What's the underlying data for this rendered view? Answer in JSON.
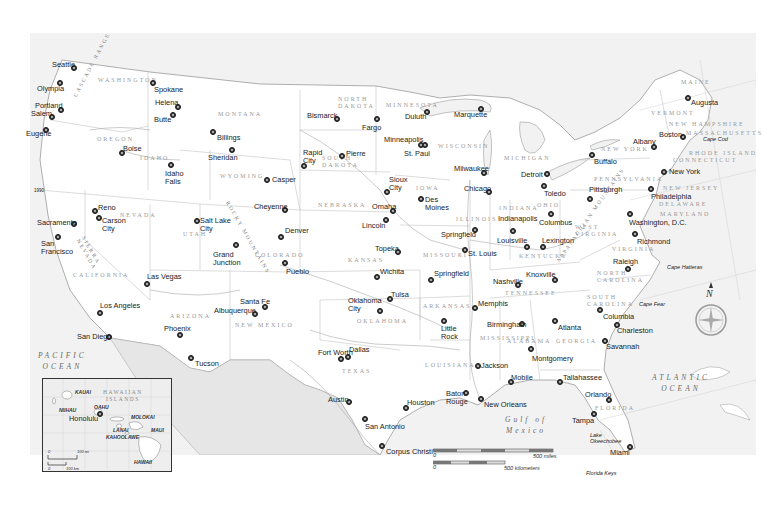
{
  "map": {
    "title": "United States reference map",
    "oceans": [
      {
        "id": "pacific",
        "label": "PACIFIC\nOCEAN"
      },
      {
        "id": "atlantic",
        "label": "ATLANTIC\nOCEAN"
      },
      {
        "id": "gulf",
        "label": "Gulf of\nMexico"
      }
    ],
    "states": [
      "WASHINGTON",
      "OREGON",
      "CALIFORNIA",
      "NEVADA",
      "IDAHO",
      "MONTANA",
      "WYOMING",
      "UTAH",
      "COLORADO",
      "ARIZONA",
      "NEW MEXICO",
      "NORTH DAKOTA",
      "SOUTH DAKOTA",
      "NEBRASKA",
      "KANSAS",
      "OKLAHOMA",
      "TEXAS",
      "MINNESOTA",
      "IOWA",
      "MISSOURI",
      "ARKANSAS",
      "LOUISIANA",
      "WISCONSIN",
      "ILLINOIS",
      "MICHIGAN",
      "INDIANA",
      "OHIO",
      "KENTUCKY",
      "TENNESSEE",
      "MISSISSIPPI",
      "ALABAMA",
      "GEORGIA",
      "FLORIDA",
      "SOUTH CAROLINA",
      "NORTH CAROLINA",
      "VIRGINIA",
      "WEST VIRGINIA",
      "PENNSYLVANIA",
      "NEW YORK",
      "VERMONT",
      "NEW HAMPSHIRE",
      "MAINE",
      "MASSACHUSETTS",
      "RHODE ISLAND",
      "CONNECTICUT",
      "NEW JERSEY",
      "DELAWARE",
      "MARYLAND"
    ],
    "mountains": [
      "CASCADE RANGE",
      "SIERRA NEVADA",
      "ROCKY MOUNTAINS",
      "APPALACHIAN MOUNTAINS"
    ],
    "features": [
      "Cape Cod",
      "Cape Hatteras",
      "Cape Fear",
      "Florida Keys",
      "Lake Okeechobee",
      "Great Salt Lake",
      "Lake Superior",
      "Lake Michigan",
      "Lake Huron",
      "Lake Erie",
      "Lake Ontario"
    ],
    "rivers": [
      "Columbia",
      "Snake",
      "Missouri",
      "Mississippi",
      "Arkansas",
      "Red",
      "Rio Grande",
      "Colorado",
      "Ohio",
      "Tennessee"
    ],
    "cities": [
      {
        "name": "Seattle",
        "x": 74,
        "y": 68,
        "lx": 52,
        "ly": 61
      },
      {
        "name": "Olympia",
        "x": 60,
        "y": 83,
        "lx": 37,
        "ly": 85
      },
      {
        "name": "Spokane",
        "x": 153,
        "y": 83,
        "lx": 154,
        "ly": 86
      },
      {
        "name": "Portland",
        "x": 61,
        "y": 110,
        "lx": 35,
        "ly": 102
      },
      {
        "name": "Salem",
        "x": 52,
        "y": 117,
        "lx": 31,
        "ly": 110
      },
      {
        "name": "Eugene",
        "x": 46,
        "y": 130,
        "lx": 26,
        "ly": 130
      },
      {
        "name": "Helena",
        "x": 178,
        "y": 107,
        "lx": 155,
        "ly": 99
      },
      {
        "name": "Butte",
        "x": 173,
        "y": 115,
        "lx": 154,
        "ly": 116
      },
      {
        "name": "Billings",
        "x": 213,
        "y": 132,
        "lx": 217,
        "ly": 134
      },
      {
        "name": "Boise",
        "x": 122,
        "y": 153,
        "lx": 123,
        "ly": 145
      },
      {
        "name": "Sheridan",
        "x": 232,
        "y": 150,
        "lx": 208,
        "ly": 154
      },
      {
        "name": "Idaho\nFalls",
        "x": 171,
        "y": 165,
        "lx": 165,
        "ly": 170
      },
      {
        "name": "Casper",
        "x": 267,
        "y": 180,
        "lx": 272,
        "ly": 176
      },
      {
        "name": "Cheyenne",
        "x": 285,
        "y": 210,
        "lx": 254,
        "ly": 203
      },
      {
        "name": "Salt Lake\nCity",
        "x": 197,
        "y": 221,
        "lx": 200,
        "ly": 217
      },
      {
        "name": "Reno",
        "x": 95,
        "y": 211,
        "lx": 98,
        "ly": 204
      },
      {
        "name": "Carson\nCity",
        "x": 99,
        "y": 218,
        "lx": 102,
        "ly": 217
      },
      {
        "name": "Sacramento",
        "x": 74,
        "y": 224,
        "lx": 37,
        "ly": 219
      },
      {
        "name": "San\nFrancisco",
        "x": 58,
        "y": 237,
        "lx": 41,
        "ly": 240
      },
      {
        "name": "Denver",
        "x": 281,
        "y": 237,
        "lx": 285,
        "ly": 227
      },
      {
        "name": "Grand\nJunction",
        "x": 236,
        "y": 245,
        "lx": 213,
        "ly": 251
      },
      {
        "name": "Pueblo",
        "x": 285,
        "y": 263,
        "lx": 286,
        "ly": 268
      },
      {
        "name": "Las Vegas",
        "x": 147,
        "y": 284,
        "lx": 147,
        "ly": 273
      },
      {
        "name": "Santa Fe",
        "x": 265,
        "y": 307,
        "lx": 240,
        "ly": 298
      },
      {
        "name": "Albuquerque",
        "x": 255,
        "y": 314,
        "lx": 214,
        "ly": 307
      },
      {
        "name": "Los Angeles",
        "x": 100,
        "y": 313,
        "lx": 100,
        "ly": 302
      },
      {
        "name": "Phoenix",
        "x": 180,
        "y": 335,
        "lx": 164,
        "ly": 325
      },
      {
        "name": "San Diego",
        "x": 109,
        "y": 337,
        "lx": 77,
        "ly": 333
      },
      {
        "name": "Tucson",
        "x": 191,
        "y": 358,
        "lx": 195,
        "ly": 360
      },
      {
        "name": "Bismarck",
        "x": 337,
        "y": 119,
        "lx": 307,
        "ly": 112
      },
      {
        "name": "Fargo",
        "x": 377,
        "y": 119,
        "lx": 362,
        "ly": 124
      },
      {
        "name": "Rapid\nCity",
        "x": 304,
        "y": 166,
        "lx": 303,
        "ly": 149
      },
      {
        "name": "Pierre",
        "x": 342,
        "y": 156,
        "lx": 346,
        "ly": 150
      },
      {
        "name": "Duluth",
        "x": 427,
        "y": 112,
        "lx": 405,
        "ly": 113
      },
      {
        "name": "Marquette",
        "x": 481,
        "y": 109,
        "lx": 454,
        "ly": 111
      },
      {
        "name": "Minneapolis",
        "x": 421,
        "y": 145,
        "lx": 384,
        "ly": 136
      },
      {
        "name": "St. Paul",
        "x": 425,
        "y": 145,
        "lx": 404,
        "ly": 150
      },
      {
        "name": "Milwaukee",
        "x": 484,
        "y": 173,
        "lx": 454,
        "ly": 165
      },
      {
        "name": "Chicago",
        "x": 489,
        "y": 192,
        "lx": 464,
        "ly": 185
      },
      {
        "name": "Sioux\nCity",
        "x": 387,
        "y": 192,
        "lx": 389,
        "ly": 176
      },
      {
        "name": "Omaha",
        "x": 393,
        "y": 211,
        "lx": 372,
        "ly": 203
      },
      {
        "name": "Des\nMoines",
        "x": 421,
        "y": 199,
        "lx": 425,
        "ly": 196
      },
      {
        "name": "Lincoln",
        "x": 386,
        "y": 220,
        "lx": 362,
        "ly": 222
      },
      {
        "name": "Topeka",
        "x": 398,
        "y": 252,
        "lx": 375,
        "ly": 245
      },
      {
        "name": "Springfield",
        "x": 475,
        "y": 230,
        "lx": 441,
        "ly": 231
      },
      {
        "name": "Indianapolis",
        "x": 513,
        "y": 231,
        "lx": 498,
        "ly": 215
      },
      {
        "name": "St. Louis",
        "x": 465,
        "y": 250,
        "lx": 468,
        "ly": 250
      },
      {
        "name": "Louisville",
        "x": 527,
        "y": 247,
        "lx": 497,
        "ly": 237
      },
      {
        "name": "Wichita",
        "x": 377,
        "y": 277,
        "lx": 380,
        "ly": 268
      },
      {
        "name": "Springfield",
        "x": 431,
        "y": 280,
        "lx": 434,
        "ly": 270
      },
      {
        "name": "Tulsa",
        "x": 390,
        "y": 299,
        "lx": 391,
        "ly": 291
      },
      {
        "name": "Oklahoma\nCity",
        "x": 380,
        "y": 311,
        "lx": 348,
        "ly": 297
      },
      {
        "name": "Nashville",
        "x": 518,
        "y": 285,
        "lx": 493,
        "ly": 278
      },
      {
        "name": "Memphis",
        "x": 475,
        "y": 308,
        "lx": 478,
        "ly": 300
      },
      {
        "name": "Little\nRock",
        "x": 444,
        "y": 321,
        "lx": 441,
        "ly": 325
      },
      {
        "name": "Fort Worth",
        "x": 341,
        "y": 359,
        "lx": 318,
        "ly": 349
      },
      {
        "name": "Dallas",
        "x": 348,
        "y": 357,
        "lx": 349,
        "ly": 346
      },
      {
        "name": "Jackson",
        "x": 478,
        "y": 366,
        "lx": 481,
        "ly": 362
      },
      {
        "name": "Birmingham",
        "x": 522,
        "y": 324,
        "lx": 487,
        "ly": 321
      },
      {
        "name": "Atlanta",
        "x": 555,
        "y": 321,
        "lx": 558,
        "ly": 324
      },
      {
        "name": "Montgomery",
        "x": 531,
        "y": 349,
        "lx": 532,
        "ly": 355
      },
      {
        "name": "Austin",
        "x": 349,
        "y": 402,
        "lx": 328,
        "ly": 396
      },
      {
        "name": "Houston",
        "x": 406,
        "y": 408,
        "lx": 407,
        "ly": 399
      },
      {
        "name": "San Antonio",
        "x": 365,
        "y": 419,
        "lx": 365,
        "ly": 423
      },
      {
        "name": "Baton\nRouge",
        "x": 466,
        "y": 393,
        "lx": 446,
        "ly": 390
      },
      {
        "name": "New Orleans",
        "x": 481,
        "y": 399,
        "lx": 484,
        "ly": 401
      },
      {
        "name": "Mobile",
        "x": 511,
        "y": 382,
        "lx": 511,
        "ly": 374
      },
      {
        "name": "Tallahassee",
        "x": 560,
        "y": 382,
        "lx": 563,
        "ly": 374
      },
      {
        "name": "Corpus Christi",
        "x": 382,
        "y": 446,
        "lx": 386,
        "ly": 448
      },
      {
        "name": "Orlando",
        "x": 609,
        "y": 400,
        "lx": 585,
        "ly": 391
      },
      {
        "name": "Tampa",
        "x": 594,
        "y": 414,
        "lx": 572,
        "ly": 417
      },
      {
        "name": "Miami",
        "x": 630,
        "y": 447,
        "lx": 610,
        "ly": 449
      },
      {
        "name": "Detroit",
        "x": 547,
        "y": 174,
        "lx": 521,
        "ly": 171
      },
      {
        "name": "Toledo",
        "x": 544,
        "y": 186,
        "lx": 544,
        "ly": 190
      },
      {
        "name": "Columbus",
        "x": 551,
        "y": 214,
        "lx": 539,
        "ly": 219
      },
      {
        "name": "Lexington",
        "x": 543,
        "y": 247,
        "lx": 542,
        "ly": 237
      },
      {
        "name": "Knoxville",
        "x": 555,
        "y": 280,
        "lx": 526,
        "ly": 271
      },
      {
        "name": "Pittsburgh",
        "x": 590,
        "y": 199,
        "lx": 589,
        "ly": 186
      },
      {
        "name": "Buffalo",
        "x": 592,
        "y": 155,
        "lx": 594,
        "ly": 158
      },
      {
        "name": "Albany",
        "x": 654,
        "y": 147,
        "lx": 633,
        "ly": 138
      },
      {
        "name": "Boston",
        "x": 683,
        "y": 137,
        "lx": 659,
        "ly": 131
      },
      {
        "name": "Augusta",
        "x": 688,
        "y": 98,
        "lx": 691,
        "ly": 99
      },
      {
        "name": "New York",
        "x": 664,
        "y": 172,
        "lx": 669,
        "ly": 168
      },
      {
        "name": "Philadelphia",
        "x": 651,
        "y": 189,
        "lx": 651,
        "ly": 193
      },
      {
        "name": "Washington, D.C.",
        "x": 630,
        "y": 214,
        "lx": 629,
        "ly": 219
      },
      {
        "name": "Richmond",
        "x": 635,
        "y": 234,
        "lx": 637,
        "ly": 238
      },
      {
        "name": "Raleigh",
        "x": 628,
        "y": 269,
        "lx": 613,
        "ly": 258
      },
      {
        "name": "Columbia",
        "x": 600,
        "y": 310,
        "lx": 603,
        "ly": 313
      },
      {
        "name": "Charleston",
        "x": 617,
        "y": 325,
        "lx": 617,
        "ly": 327
      },
      {
        "name": "Savannah",
        "x": 605,
        "y": 341,
        "lx": 606,
        "ly": 343
      }
    ],
    "capes": [
      {
        "name": "Cape Cod",
        "x": 703,
        "y": 136
      },
      {
        "name": "Cape Hatteras",
        "x": 667,
        "y": 264
      },
      {
        "name": "Cape Fear",
        "x": 639,
        "y": 301
      },
      {
        "name": "Florida Keys",
        "x": 586,
        "y": 470
      },
      {
        "name": "Lake\nOkeechobee",
        "x": 590,
        "y": 432
      }
    ],
    "state_labels": [
      {
        "name": "WASHINGTON",
        "x": 98,
        "y": 77
      },
      {
        "name": "OREGON",
        "x": 97,
        "y": 136
      },
      {
        "name": "CALIFORNIA",
        "x": 73,
        "y": 272
      },
      {
        "name": "NEVADA",
        "x": 120,
        "y": 212
      },
      {
        "name": "IDAHO",
        "x": 140,
        "y": 155
      },
      {
        "name": "MONTANA",
        "x": 218,
        "y": 111
      },
      {
        "name": "WYOMING",
        "x": 220,
        "y": 173
      },
      {
        "name": "UTAH",
        "x": 183,
        "y": 231
      },
      {
        "name": "COLORADO",
        "x": 255,
        "y": 252
      },
      {
        "name": "ARIZONA",
        "x": 170,
        "y": 313
      },
      {
        "name": "NEW MEXICO",
        "x": 235,
        "y": 322
      },
      {
        "name": "NORTH\nDAKOTA",
        "x": 338,
        "y": 96
      },
      {
        "name": "SOUTH\nDAKOTA",
        "x": 322,
        "y": 155
      },
      {
        "name": "NEBRASKA",
        "x": 318,
        "y": 202
      },
      {
        "name": "KANSAS",
        "x": 348,
        "y": 257
      },
      {
        "name": "OKLAHOMA",
        "x": 357,
        "y": 318
      },
      {
        "name": "TEXAS",
        "x": 342,
        "y": 368
      },
      {
        "name": "MINNESOTA",
        "x": 386,
        "y": 102
      },
      {
        "name": "IOWA",
        "x": 416,
        "y": 185
      },
      {
        "name": "MISSOURI",
        "x": 423,
        "y": 252
      },
      {
        "name": "ARKANSAS",
        "x": 423,
        "y": 303
      },
      {
        "name": "LOUISIANA",
        "x": 425,
        "y": 362
      },
      {
        "name": "WISCONSIN",
        "x": 438,
        "y": 143
      },
      {
        "name": "ILLINOIS",
        "x": 456,
        "y": 216
      },
      {
        "name": "MICHIGAN",
        "x": 504,
        "y": 155
      },
      {
        "name": "INDIANA",
        "x": 499,
        "y": 205
      },
      {
        "name": "OHIO",
        "x": 537,
        "y": 202
      },
      {
        "name": "KENTUCKY",
        "x": 519,
        "y": 253
      },
      {
        "name": "TENNESSEE",
        "x": 505,
        "y": 290
      },
      {
        "name": "MISSISSIPPI",
        "x": 480,
        "y": 335
      },
      {
        "name": "ALABAMA",
        "x": 507,
        "y": 338
      },
      {
        "name": "GEORGIA",
        "x": 556,
        "y": 338
      },
      {
        "name": "FLORIDA",
        "x": 595,
        "y": 405
      },
      {
        "name": "SOUTH\nCAROLINA",
        "x": 587,
        "y": 294
      },
      {
        "name": "NORTH\nCAROLINA",
        "x": 597,
        "y": 270
      },
      {
        "name": "VIRGINIA",
        "x": 612,
        "y": 246
      },
      {
        "name": "WEST\nVIRGINIA",
        "x": 575,
        "y": 224
      },
      {
        "name": "PENNSYLVANIA",
        "x": 594,
        "y": 176
      },
      {
        "name": "NEW YORK",
        "x": 601,
        "y": 146
      },
      {
        "name": "VERMONT",
        "x": 651,
        "y": 110
      },
      {
        "name": "NEW HAMPSHIRE",
        "x": 669,
        "y": 121
      },
      {
        "name": "MAINE",
        "x": 681,
        "y": 79
      },
      {
        "name": "MASSACHUSETTS",
        "x": 686,
        "y": 130
      },
      {
        "name": "RHODE ISLAND",
        "x": 689,
        "y": 150
      },
      {
        "name": "CONNECTICUT",
        "x": 673,
        "y": 157
      },
      {
        "name": "NEW JERSEY",
        "x": 663,
        "y": 185
      },
      {
        "name": "DELAWARE",
        "x": 659,
        "y": 201
      },
      {
        "name": "MARYLAND",
        "x": 660,
        "y": 211
      }
    ],
    "mountain_labels": [
      {
        "name": "CASCADE RANGE",
        "x": 72,
        "y": 95,
        "rot": -62
      },
      {
        "name": "SIERRA\nNEVADA",
        "x": 86,
        "y": 235,
        "rot": 60
      },
      {
        "name": "ROCKY MOUNTAINS",
        "x": 230,
        "y": 200,
        "rot": 60
      },
      {
        "name": "APPALACHIAN MOUNTAINS",
        "x": 555,
        "y": 260,
        "rot": -55
      }
    ]
  },
  "hawaii_inset": {
    "title": "HAWAIIAN\nISLANDS",
    "islands": [
      {
        "name": "KAUAI",
        "x": 32,
        "y": 56
      },
      {
        "name": "NIIHAU",
        "x": 16,
        "y": 74
      },
      {
        "name": "OAHU",
        "x": 51,
        "y": 71
      },
      {
        "name": "MOLOKAI",
        "x": 88,
        "y": 81
      },
      {
        "name": "LANAI",
        "x": 70,
        "y": 94
      },
      {
        "name": "MAUI",
        "x": 108,
        "y": 94
      },
      {
        "name": "KAHOOLAWE",
        "x": 63,
        "y": 101
      },
      {
        "name": "HAWAII",
        "x": 91,
        "y": 126
      }
    ],
    "capital": "Honolulu",
    "scale_miles": "100 mi",
    "scale_km": "100 km",
    "scale_zero": "0"
  },
  "scale_bar": {
    "zero": "0",
    "miles_label": "500 miles",
    "km_label": "500 kilometers"
  },
  "compass": {
    "label": "N"
  },
  "misc": {
    "coast_label": "1990"
  }
}
